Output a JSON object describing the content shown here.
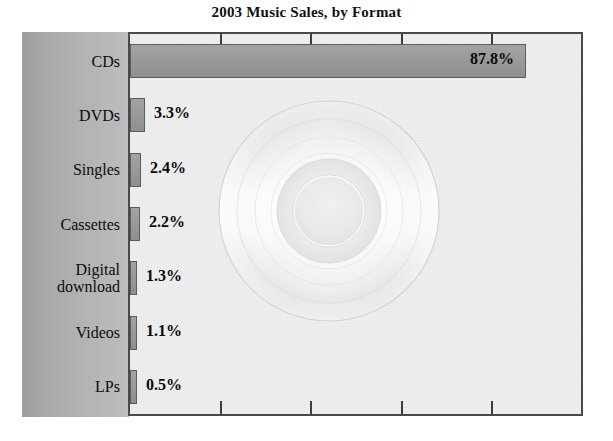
{
  "chart_data": {
    "type": "bar",
    "orientation": "horizontal",
    "title": "2003 Music Sales, by Format",
    "xlabel": "",
    "ylabel": "",
    "categories": [
      "CDs",
      "DVDs",
      "Singles",
      "Cassettes",
      "Digital download",
      "Videos",
      "LPs"
    ],
    "values": [
      87.8,
      3.3,
      2.4,
      2.2,
      1.3,
      1.1,
      0.5
    ],
    "value_labels": [
      "87.8%",
      "3.3%",
      "2.4%",
      "2.2%",
      "1.3%",
      "1.1%",
      "0.5%"
    ],
    "xlim": [
      0,
      100
    ],
    "x_tick_count": 4,
    "x_tick_labels": [],
    "grid": false,
    "legend": null,
    "units": "percent of total music sales",
    "watermark": "cd-disc-image"
  },
  "title": "2003 Music Sales, by Format",
  "categories": [
    {
      "label": "CDs",
      "lines": [
        "CDs"
      ],
      "value": 87.8,
      "value_label": "87.8%",
      "label_inside": true
    },
    {
      "label": "DVDs",
      "lines": [
        "DVDs"
      ],
      "value": 3.3,
      "value_label": "3.3%",
      "label_inside": false
    },
    {
      "label": "Singles",
      "lines": [
        "Singles"
      ],
      "value": 2.4,
      "value_label": "2.4%",
      "label_inside": false
    },
    {
      "label": "Cassettes",
      "lines": [
        "Cassettes"
      ],
      "value": 2.2,
      "value_label": "2.2%",
      "label_inside": false
    },
    {
      "label": "Digital download",
      "lines": [
        "Digital",
        "download"
      ],
      "value": 1.3,
      "value_label": "1.3%",
      "label_inside": false
    },
    {
      "label": "Videos",
      "lines": [
        "Videos"
      ],
      "value": 1.1,
      "value_label": "1.1%",
      "label_inside": false
    },
    {
      "label": "LPs",
      "lines": [
        "LPs"
      ],
      "value": 0.5,
      "value_label": "0.5%",
      "label_inside": false
    }
  ],
  "colors": {
    "bar_fill": "#9a9a9a",
    "bar_border": "#5d5d5d",
    "panel_gray": "#b0b0b0",
    "plot_background": "#eeeeee",
    "plot_border": "#4a4a4a",
    "text": "#000000"
  }
}
